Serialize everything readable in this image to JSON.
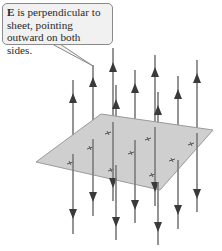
{
  "callout": {
    "symbol": "E",
    "text": " is perpendicular to sheet, pointing outward on both sides."
  },
  "colors": {
    "line": "#7a7a7a",
    "arrow": "#3a3a3a",
    "sheet_fill": "#cfcfcf",
    "sheet_edge": "#9a9a9a",
    "callout_fill": "#f1f1f1",
    "callout_border": "#8a8a8a"
  },
  "sheet": {
    "corners": [
      [
        36,
        162
      ],
      [
        101,
        114
      ],
      [
        213,
        130
      ],
      [
        160,
        190
      ]
    ]
  },
  "field_lines": [
    {
      "x": 73,
      "top": 80,
      "up_arrow": 98,
      "plane_y": 154,
      "bottom": 234,
      "down_arrow": 214
    },
    {
      "x": 93,
      "top": 65,
      "up_arrow": 82,
      "plane_y": 139,
      "bottom": 216,
      "down_arrow": 197
    },
    {
      "x": 113,
      "top": 48,
      "up_arrow": 67,
      "plane_y": 122,
      "bottom": 201,
      "down_arrow": 183
    },
    {
      "x": 116,
      "top": 85,
      "up_arrow": 104,
      "plane_y": 165,
      "bottom": 240,
      "down_arrow": 222
    },
    {
      "x": 135,
      "top": 70,
      "up_arrow": 88,
      "plane_y": 140,
      "bottom": 223,
      "down_arrow": 205
    },
    {
      "x": 155,
      "top": 55,
      "up_arrow": 72,
      "plane_y": 127,
      "bottom": 206,
      "down_arrow": 187
    },
    {
      "x": 158,
      "top": 92,
      "up_arrow": 110,
      "plane_y": 182,
      "bottom": 245,
      "down_arrow": 227
    },
    {
      "x": 178,
      "top": 76,
      "up_arrow": 94,
      "plane_y": 160,
      "bottom": 229,
      "down_arrow": 210
    },
    {
      "x": 197,
      "top": 60,
      "up_arrow": 78,
      "plane_y": 133,
      "bottom": 212,
      "down_arrow": 194
    }
  ],
  "sheet_marks": [
    [
      70,
      163
    ],
    [
      90,
      148
    ],
    [
      108,
      133
    ],
    [
      111,
      170
    ],
    [
      131,
      153
    ],
    [
      148,
      139
    ],
    [
      152,
      175
    ],
    [
      172,
      160
    ],
    [
      191,
      144
    ]
  ]
}
